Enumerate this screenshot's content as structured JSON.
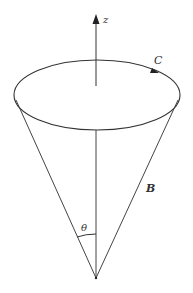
{
  "diagram": {
    "labels": {
      "z_axis": "z",
      "curve": "C",
      "vector": "B",
      "angle": "θ"
    },
    "colors": {
      "stroke": "#333333",
      "background": "#ffffff"
    },
    "geometry": {
      "ellipse": {
        "cx": 97,
        "cy": 95,
        "rx": 83,
        "ry": 35
      },
      "apex": {
        "x": 96,
        "y": 278
      },
      "axis_top": {
        "x": 96,
        "y": 16
      }
    }
  }
}
